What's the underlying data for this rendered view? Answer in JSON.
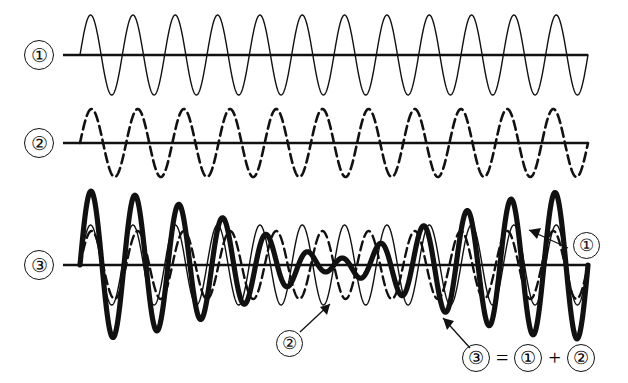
{
  "figure": {
    "background_color": "#ffffff",
    "ink_color": "#111111",
    "width": 628,
    "height": 383
  },
  "rows": [
    {
      "id": "row-1",
      "label": "①",
      "label_plain": "1",
      "style": "thin-solid",
      "axis_y": 55,
      "axis_x_start": 63,
      "axis_x_end": 588
    },
    {
      "id": "row-2",
      "label": "②",
      "label_plain": "2",
      "style": "thin-dashed",
      "axis_y": 143,
      "axis_x_start": 63,
      "axis_x_end": 588
    },
    {
      "id": "row-3",
      "label": "③",
      "label_plain": "3",
      "style": "thick-solid-sum",
      "axis_y": 265,
      "axis_x_start": 63,
      "axis_x_end": 588
    }
  ],
  "callouts": [
    {
      "id": "callout-wave1",
      "label": "①",
      "label_plain": "1",
      "points_to": "thin solid wave in row 3"
    },
    {
      "id": "callout-wave2",
      "label": "②",
      "label_plain": "2",
      "points_to": "dashed wave in row 3"
    },
    {
      "id": "callout-wave3",
      "label": "③",
      "label_plain": "3",
      "points_to": "thick sum wave in row 3"
    }
  ],
  "formula": {
    "result": "③",
    "result_plain": "3",
    "equals": "=",
    "operand_a": "①",
    "operand_a_plain": "1",
    "plus": "+",
    "operand_b": "②",
    "operand_b_plain": "2",
    "text": "③ = ① + ②"
  },
  "chart_data": {
    "type": "line",
    "xlabel": "",
    "ylabel": "",
    "grid": false,
    "legend_position": "inline-callouts",
    "x_start": 80,
    "x_end": 588,
    "series": [
      {
        "name": "①",
        "name_plain": "wave-1",
        "row": 1,
        "linestyle": "solid",
        "linewidth_px": 1.4,
        "amplitude_px": 40,
        "cycles": 12,
        "phase_deg": 0,
        "baseline_y": 55,
        "color": "#111111"
      },
      {
        "name": "②",
        "name_plain": "wave-2",
        "row": 2,
        "linestyle": "dashed",
        "linewidth_px": 2.6,
        "dash_pattern": "9,5",
        "amplitude_px": 34,
        "cycles": 11,
        "phase_deg": 0,
        "baseline_y": 143,
        "color": "#111111"
      },
      {
        "name": "① (overlay)",
        "name_plain": "wave-1-overlay",
        "row": 3,
        "linestyle": "solid",
        "linewidth_px": 1.4,
        "amplitude_px": 40,
        "cycles": 12,
        "phase_deg": 0,
        "baseline_y": 265,
        "color": "#111111"
      },
      {
        "name": "② (overlay)",
        "name_plain": "wave-2-overlay",
        "row": 3,
        "linestyle": "dashed",
        "linewidth_px": 2.4,
        "dash_pattern": "9,5",
        "amplitude_px": 34,
        "cycles": 11,
        "phase_deg": 0,
        "baseline_y": 265,
        "color": "#111111"
      },
      {
        "name": "③ = ① + ②",
        "name_plain": "wave-3-sum",
        "row": 3,
        "linestyle": "solid",
        "linewidth_px": 5.2,
        "amplitude_px": 74,
        "cycles": 11.5,
        "beat_cycles": 1,
        "phase_deg": 0,
        "baseline_y": 265,
        "color": "#111111"
      }
    ]
  }
}
